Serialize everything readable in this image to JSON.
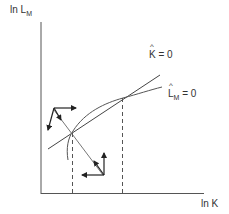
{
  "diagram": {
    "type": "phase-diagram",
    "y_axis": {
      "label_main": "ln L",
      "label_sub": "M"
    },
    "x_axis": {
      "label": "ln K"
    },
    "curves": [
      {
        "id": "k-hat-zero",
        "label_var": "K",
        "label_rest": " = 0",
        "shape": "straight line"
      },
      {
        "id": "lm-hat-zero",
        "label_var": "L",
        "label_sub": "M",
        "label_rest": " = 0",
        "shape": "concave curve"
      }
    ],
    "equilibria": [
      {
        "id": "low",
        "note": "saddle point with stable arm"
      },
      {
        "id": "high",
        "note": "upper intersection"
      }
    ],
    "colors": {
      "axis": "#555555",
      "line": "#444444",
      "curve": "#555555",
      "saddle": "#666666",
      "arrows": "#222222"
    }
  }
}
